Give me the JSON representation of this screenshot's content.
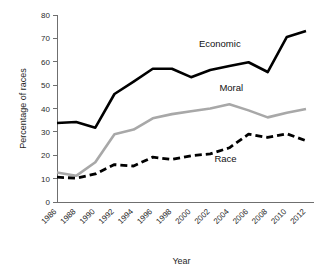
{
  "chart_data": {
    "type": "line",
    "title": "",
    "xlabel": "Year",
    "ylabel": "Percentage of races",
    "xlim": [
      1986,
      2012
    ],
    "ylim": [
      0,
      80
    ],
    "ytick_step": 10,
    "grid": false,
    "legend_position": "inline-annotations",
    "categories": [
      "1986",
      "1988",
      "1990",
      "1992",
      "1994",
      "1996",
      "1998",
      "2000",
      "2002",
      "2004",
      "2006",
      "2008",
      "2010",
      "2012"
    ],
    "yticks": [
      "0",
      "10",
      "20",
      "30",
      "40",
      "50",
      "60",
      "70",
      "80"
    ],
    "series": [
      {
        "name": "Economic",
        "color": "#000000",
        "style": "solid",
        "width": 2.6,
        "label_x": 2003.0,
        "label_y": 66.5,
        "values": [
          33.8,
          34.2,
          31.8,
          46.2,
          51.5,
          57.0,
          57.0,
          53.4,
          56.5,
          58.2,
          59.8,
          55.6,
          70.6,
          73.2
        ]
      },
      {
        "name": "Moral",
        "color": "#a8a8a8",
        "style": "solid",
        "width": 2.6,
        "label_x": 2004.2,
        "label_y": 47.5,
        "values": [
          12.6,
          11.2,
          17.0,
          29.0,
          31.0,
          35.8,
          37.6,
          38.8,
          40.0,
          41.8,
          39.2,
          36.2,
          38.2,
          39.8
        ]
      },
      {
        "name": "Race",
        "color": "#000000",
        "style": "dashed",
        "width": 2.8,
        "dasharray": "7,4",
        "label_x": 2003.6,
        "label_y": 17.2,
        "values": [
          10.6,
          10.2,
          12.0,
          16.0,
          15.4,
          19.2,
          18.2,
          19.8,
          20.6,
          23.2,
          29.0,
          27.6,
          29.2,
          26.2
        ]
      }
    ]
  }
}
